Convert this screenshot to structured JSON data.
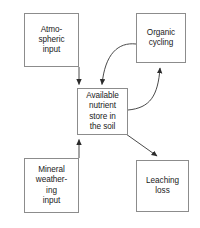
{
  "diagram": {
    "type": "flow-diagram",
    "background_color": "#ffffff",
    "box_border_color": "#8c8c8c",
    "text_color": "#1a1a1a",
    "arrow_color": "#333333",
    "nodes": [
      {
        "id": "atmospheric-input",
        "label": "Atmo-\nspheric\ninput",
        "text": "Atmospheric input",
        "x": 24,
        "y": 13,
        "width": 55,
        "height": 54
      },
      {
        "id": "organic-cycling",
        "label": "Organic\ncycling",
        "text": "Organic cycling",
        "x": 136,
        "y": 13,
        "width": 50,
        "height": 50
      },
      {
        "id": "available-nutrient-store",
        "label": "Available\nnutrient\nstore in\nthe soil",
        "text": "Available nutrient store in the soil",
        "x": 77,
        "y": 88,
        "width": 51,
        "height": 47
      },
      {
        "id": "mineral-weathering-input",
        "label": "Mineral\nweather-\ning\ninput",
        "text": "Mineral weathering input",
        "x": 24,
        "y": 158,
        "width": 55,
        "height": 55
      },
      {
        "id": "leaching-loss",
        "label": "Leaching\nloss",
        "text": "Leaching loss",
        "x": 136,
        "y": 160,
        "width": 53,
        "height": 52
      }
    ],
    "edges": [
      {
        "id": "edge-atmospheric-to-store",
        "from": "atmospheric-input",
        "to": "available-nutrient-store",
        "shape": "straight-vertical",
        "direction": "down"
      },
      {
        "id": "edge-mineral-to-store",
        "from": "mineral-weathering-input",
        "to": "available-nutrient-store",
        "shape": "straight-vertical",
        "direction": "up"
      },
      {
        "id": "edge-organic-to-store",
        "from": "organic-cycling",
        "to": "available-nutrient-store",
        "shape": "curved",
        "direction": "down-left"
      },
      {
        "id": "edge-store-to-organic",
        "from": "available-nutrient-store",
        "to": "organic-cycling",
        "shape": "curved",
        "direction": "up-right"
      },
      {
        "id": "edge-store-to-leaching",
        "from": "available-nutrient-store",
        "to": "leaching-loss",
        "shape": "straight-diagonal",
        "direction": "down-right"
      }
    ]
  }
}
